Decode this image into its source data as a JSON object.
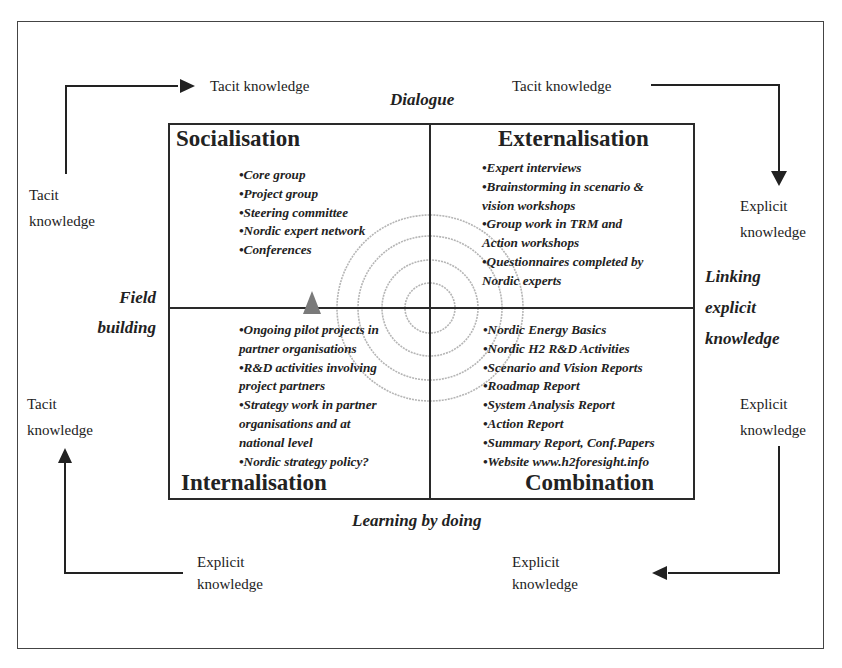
{
  "diagram": {
    "top_label": "Dialogue",
    "bottom_label": "Learning by doing",
    "left_label": [
      "Field",
      "building"
    ],
    "right_label": [
      "Linking",
      "explicit",
      "knowledge"
    ],
    "flows": {
      "top_left_text": "Tacit knowledge",
      "top_right_text": "Tacit knowledge",
      "left_upper": [
        "Tacit",
        "knowledge"
      ],
      "left_lower": [
        "Tacit",
        "knowledge"
      ],
      "right_upper": [
        "Explicit",
        "knowledge"
      ],
      "right_lower": [
        "Explicit",
        "knowledge"
      ],
      "bottom_left": [
        "Explicit",
        "knowledge"
      ],
      "bottom_right": [
        "Explicit",
        "knowledge"
      ]
    },
    "quadrants": {
      "socialisation": {
        "title": "Socialisation",
        "items": [
          "•Core group",
          "•Project group",
          "•Steering committee",
          "•Nordic expert network",
          "•Conferences"
        ]
      },
      "externalisation": {
        "title": "Externalisation",
        "items": [
          "•Expert interviews",
          "•Brainstorming in scenario &",
          "vision workshops",
          "•Group work in TRM and",
          "Action workshops",
          "•Questionnaires completed by",
          "Nordic experts"
        ]
      },
      "internalisation": {
        "title": "Internalisation",
        "items": [
          "•Ongoing pilot projects in",
          "partner organisations",
          "•R&D activities involving",
          "project partners",
          "•Strategy work in partner",
          "organisations and at",
          "national level",
          "•Nordic strategy policy?"
        ]
      },
      "combination": {
        "title": "Combination",
        "items": [
          "•Nordic Energy Basics",
          "•Nordic H2 R&D Activities",
          "•Scenario and Vision Reports",
          "•Roadmap Report",
          "•System Analysis Report",
          "•Action Report",
          "•Summary Report, Conf.Papers",
          "•Website www.h2foresight.info"
        ]
      }
    },
    "colors": {
      "line": "#2a2a2a",
      "circles": "#b5b5b5",
      "triangle": "#7a7a7a"
    }
  }
}
